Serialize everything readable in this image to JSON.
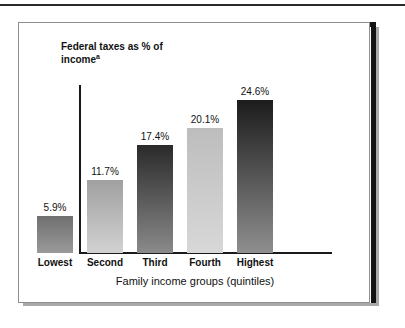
{
  "figure": {
    "frame_color": "#141414",
    "shadow_color": "#a9a9a9",
    "background": "#ffffff"
  },
  "chart_data": {
    "type": "bar",
    "title": "",
    "categories": [
      "Lowest",
      "Second",
      "Third",
      "Fourth",
      "Highest"
    ],
    "values": [
      5.9,
      11.7,
      17.4,
      20.1,
      24.6
    ],
    "value_labels": [
      "5.9%",
      "11.7%",
      "17.4%",
      "20.1%",
      "24.6%"
    ],
    "ylabel": "Federal taxes as % of income",
    "ylabel_superscript": "a",
    "xlabel": "Family income groups (quintiles)",
    "ylim": [
      0,
      27
    ],
    "grid": false,
    "legend": null,
    "bar_colors_top": [
      "#6f6f6f",
      "#a0a0a0",
      "#2a2a2a",
      "#bdbdbd",
      "#1c1c1c"
    ],
    "bar_colors_bottom": [
      "#9a9a9a",
      "#d2d2d2",
      "#8a8a8a",
      "#d8d8d8",
      "#8f8f8f"
    ]
  }
}
